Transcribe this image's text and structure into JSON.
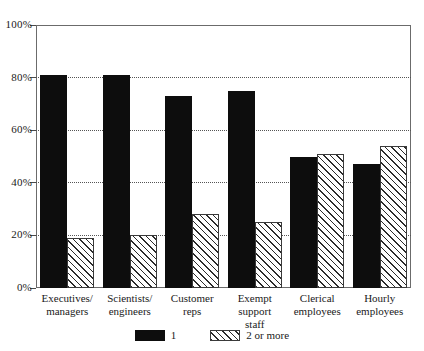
{
  "chart_data": {
    "type": "bar",
    "title": "",
    "subtitle": "",
    "xlabel": "",
    "ylabel": "",
    "ylim": [
      0,
      100
    ],
    "y_ticks": [
      "0%",
      "20%",
      "40%",
      "60%",
      "80%",
      "100%"
    ],
    "y_tick_values": [
      0,
      20,
      40,
      60,
      80,
      100
    ],
    "grid": "horizontal-dotted",
    "legend_position": "bottom-center",
    "categories": [
      "Executives/\nmanagers",
      "Scientists/\nengineers",
      "Customer\nreps",
      "Exempt support\nstaff",
      "Clerical\nemployees",
      "Hourly\nemployees"
    ],
    "series": [
      {
        "name": "1",
        "style": "solid-black",
        "values": [
          81,
          81,
          73,
          75,
          50,
          47
        ]
      },
      {
        "name": "2 or more",
        "style": "diagonal-hatch",
        "values": [
          19,
          20,
          28,
          25,
          51,
          54
        ]
      }
    ]
  },
  "legend": {
    "entries": [
      {
        "label": "1",
        "swatch": "solid-black-swatch"
      },
      {
        "label": "2 or more",
        "swatch": "diagonal-hatch-swatch"
      }
    ]
  },
  "colors": {
    "series_1": "#0d0d0d",
    "series_2_lines": "#2b2b2b",
    "series_2_fill": "#ffffff",
    "frame": "#6b6b6b",
    "gridline": "#555555",
    "text": "#1a1a1a",
    "background": "#ffffff"
  }
}
